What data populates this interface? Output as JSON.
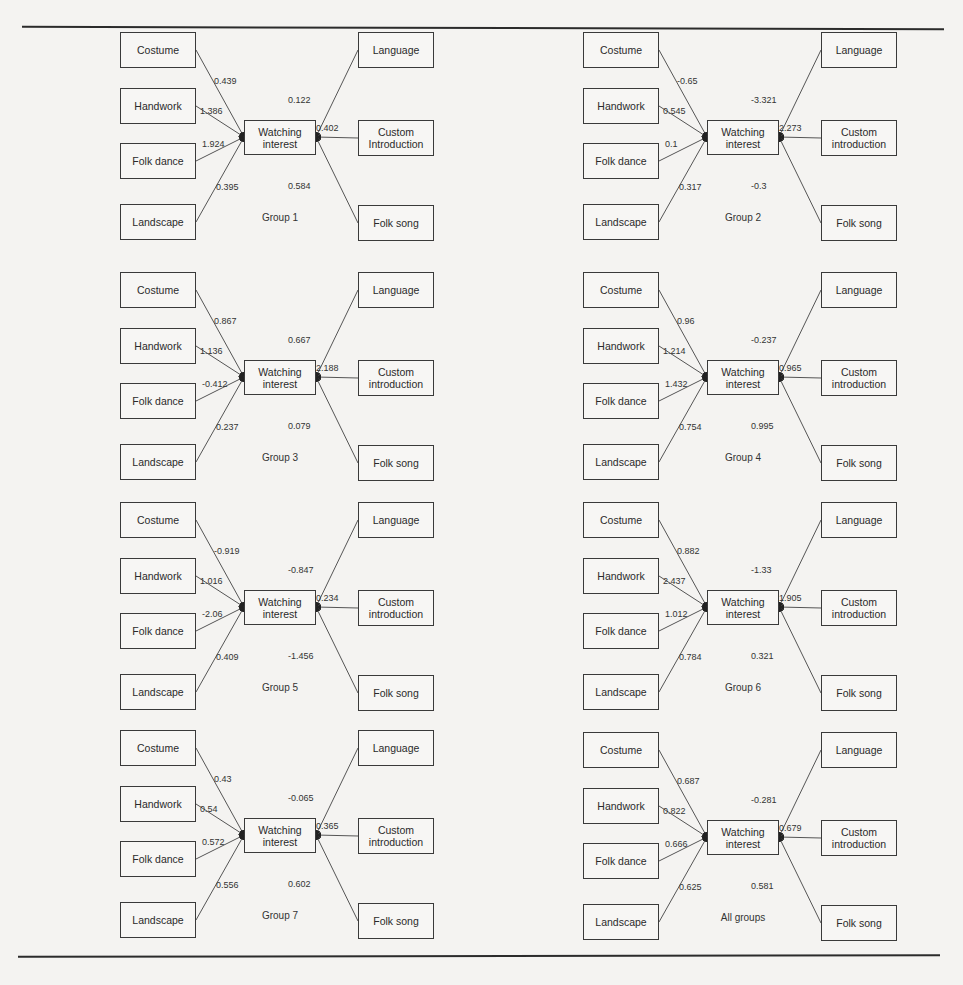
{
  "figure": {
    "center_label": "Watching\ninterest",
    "left_nodes": [
      "Costume",
      "Handwork",
      "Folk dance",
      "Landscape"
    ],
    "right_nodes": [
      "Language",
      "Custom\nintroduction",
      "Folk song"
    ]
  },
  "panels": [
    {
      "title": "Group 1",
      "right_nodes": [
        "Language",
        "Custom\nIntroduction",
        "Folk song"
      ],
      "left_coefs": [
        "0.439",
        "1.386",
        "1.924",
        "0.395"
      ],
      "right_coefs": [
        "0.122",
        "0.402",
        "0.584"
      ]
    },
    {
      "title": "Group 2",
      "right_nodes": [
        "Language",
        "Custom\nintroduction",
        "Folk song"
      ],
      "left_coefs": [
        "-0.65",
        "0.545",
        "0.1",
        "0.317"
      ],
      "right_coefs": [
        "-3.321",
        "2.273",
        "-0.3"
      ]
    },
    {
      "title": "Group 3",
      "right_nodes": [
        "Language",
        "Custom\nintroduction",
        "Folk song"
      ],
      "left_coefs": [
        "0.867",
        "1.136",
        "-0.412",
        "0.237"
      ],
      "right_coefs": [
        "0.667",
        "2.188",
        "0.079"
      ]
    },
    {
      "title": "Group 4",
      "right_nodes": [
        "Language",
        "Custom\nintroduction",
        "Folk song"
      ],
      "left_coefs": [
        "0.96",
        "1.214",
        "1.432",
        "0.754"
      ],
      "right_coefs": [
        "-0.237",
        "0.965",
        "0.995"
      ]
    },
    {
      "title": "Group 5",
      "right_nodes": [
        "Language",
        "Custom\nintroduction",
        "Folk song"
      ],
      "left_coefs": [
        "-0.919",
        "1.016",
        "-2.06",
        "0.409"
      ],
      "right_coefs": [
        "-0.847",
        "0.234",
        "-1.456"
      ]
    },
    {
      "title": "Group 6",
      "right_nodes": [
        "Language",
        "Custom\nintroduction",
        "Folk song"
      ],
      "left_coefs": [
        "0.882",
        "2.437",
        "1.012",
        "0.784"
      ],
      "right_coefs": [
        "-1.33",
        "1.905",
        "0.321"
      ]
    },
    {
      "title": "Group 7",
      "right_nodes": [
        "Language",
        "Custom\nintroduction",
        "Folk song"
      ],
      "left_coefs": [
        "0.43",
        "0.54",
        "0.572",
        "0.556"
      ],
      "right_coefs": [
        "-0.065",
        "0.365",
        "0.602"
      ]
    },
    {
      "title": "All groups",
      "right_nodes": [
        "Language",
        "Custom\nintroduction",
        "Folk song"
      ],
      "left_coefs": [
        "0.687",
        "0.822",
        "0.666",
        "0.625"
      ],
      "right_coefs": [
        "-0.281",
        "0.679",
        "0.581"
      ]
    }
  ]
}
